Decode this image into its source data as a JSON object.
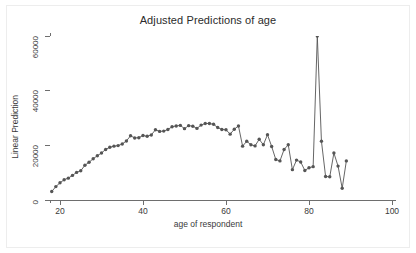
{
  "chart_data": {
    "type": "line",
    "title": "Adjusted Predictions of age",
    "xlabel": "age of respondent",
    "ylabel": "Linear Prediction",
    "xlim": [
      16,
      103
    ],
    "ylim": [
      0,
      63000
    ],
    "xticks": [
      20,
      40,
      60,
      80,
      100
    ],
    "yticks": [
      0,
      20000,
      40000,
      60000
    ],
    "grid": false,
    "marker": "circle-filled",
    "marker_color": "#555555",
    "line_color": "#555555",
    "legend": "none",
    "series": [
      {
        "name": "Linear Prediction",
        "x": [
          18,
          19,
          20,
          21,
          22,
          23,
          24,
          25,
          26,
          27,
          28,
          29,
          30,
          31,
          32,
          33,
          34,
          35,
          36,
          37,
          38,
          39,
          40,
          41,
          42,
          43,
          44,
          45,
          46,
          47,
          48,
          49,
          50,
          51,
          52,
          53,
          54,
          55,
          56,
          57,
          58,
          59,
          60,
          61,
          62,
          63,
          64,
          65,
          66,
          67,
          68,
          69,
          70,
          71,
          72,
          73,
          74,
          75,
          76,
          77,
          78,
          79,
          80,
          81,
          82,
          83,
          84,
          85,
          86,
          87,
          88,
          89
        ],
        "values": [
          3100,
          4900,
          6300,
          7400,
          8000,
          9000,
          10100,
          10700,
          12700,
          13800,
          15100,
          16200,
          17200,
          18500,
          19300,
          19700,
          19900,
          20500,
          21600,
          23500,
          22700,
          22800,
          23600,
          23300,
          23800,
          25700,
          25100,
          25200,
          25800,
          26800,
          27100,
          27300,
          26100,
          27200,
          27000,
          26200,
          27400,
          28000,
          28000,
          27700,
          26500,
          25800,
          25700,
          24100,
          25900,
          27100,
          19700,
          21500,
          20200,
          19800,
          22200,
          20200,
          23900,
          19600,
          14800,
          14300,
          18500,
          20200,
          11100,
          14600,
          13900,
          10800,
          11800,
          12200,
          60000,
          21500,
          8600,
          8500,
          17200,
          12400,
          4300,
          14300
        ]
      }
    ]
  },
  "axis": {
    "y_tick_labels": [
      "0",
      "20000",
      "40000",
      "60000"
    ],
    "x_tick_labels": [
      "20",
      "40",
      "60",
      "80",
      "100"
    ]
  }
}
